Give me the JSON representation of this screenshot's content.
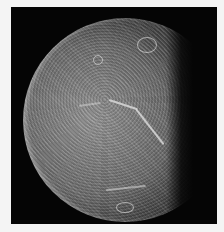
{
  "image": {
    "subject": "grayscale spacecraft photograph of a cratered icy moon, partially lit, against black space",
    "border_color": "#f4f4f4",
    "background_color": "#050505",
    "lit_side": "left",
    "terminator_side": "right"
  }
}
